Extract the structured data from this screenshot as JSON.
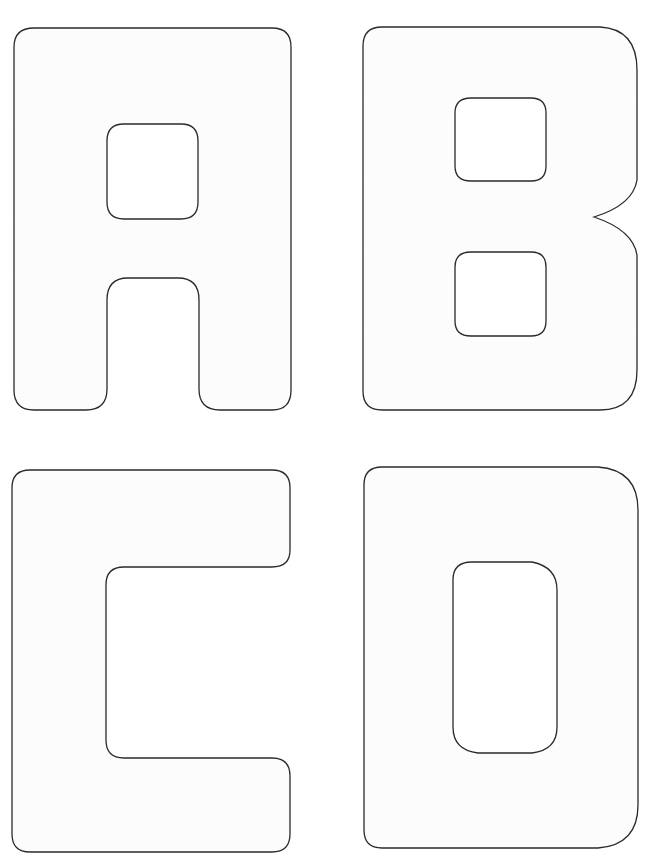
{
  "page": {
    "letters": [
      {
        "char": "A",
        "position": "top-left"
      },
      {
        "char": "B",
        "position": "top-right"
      },
      {
        "char": "C",
        "position": "bottom-left"
      },
      {
        "char": "D",
        "position": "bottom-right"
      }
    ],
    "colors": {
      "stroke": "#2a2a2a",
      "fill": "#fcfcfc",
      "background": "#ffffff"
    }
  }
}
